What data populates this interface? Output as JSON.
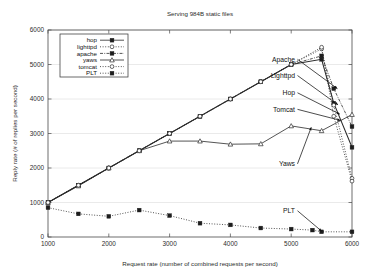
{
  "chart_data": {
    "type": "line",
    "title": "Serving 984B static files",
    "xlabel": "Request rate (number of combined requests per second)",
    "ylabel": "Reply rate (# of replies per second)",
    "xlim": [
      1000,
      6000
    ],
    "ylim": [
      0,
      6000
    ],
    "xticks": [
      1000,
      2000,
      3000,
      4000,
      5000,
      6000
    ],
    "yticks": [
      0,
      1000,
      2000,
      3000,
      4000,
      5000,
      6000
    ],
    "grid": true,
    "legend_position": "top-left",
    "series": [
      {
        "name": "hop",
        "marker": "filled-square",
        "dash": "solid",
        "x": [
          1000,
          1500,
          2000,
          2500,
          3000,
          3500,
          4000,
          4500,
          5000,
          5500,
          5700,
          6000
        ],
        "y": [
          1000,
          1500,
          2000,
          2500,
          3000,
          3500,
          4000,
          4500,
          5000,
          5150,
          3880,
          2600
        ]
      },
      {
        "name": "lighttpd",
        "marker": "open-circle",
        "dash": "dotted",
        "x": [
          1000,
          1500,
          2000,
          2500,
          3000,
          3500,
          4000,
          4500,
          5000,
          5500,
          5700,
          6000
        ],
        "y": [
          1000,
          1500,
          2000,
          2500,
          3000,
          3500,
          4000,
          4500,
          5000,
          5450,
          3820,
          1700
        ]
      },
      {
        "name": "apache",
        "marker": "filled-square",
        "dash": "dash-dot",
        "x": [
          1000,
          1500,
          2000,
          2500,
          3000,
          3500,
          4000,
          4500,
          5000,
          5500,
          5700,
          6000
        ],
        "y": [
          1000,
          1500,
          2000,
          2500,
          3000,
          3500,
          4000,
          4500,
          5000,
          5250,
          4300,
          3200
        ]
      },
      {
        "name": "yaws",
        "marker": "open-triangle",
        "dash": "solid",
        "x": [
          1000,
          1500,
          2000,
          2500,
          3000,
          3500,
          4000,
          4500,
          5000,
          5500,
          6000
        ],
        "y": [
          1000,
          1480,
          2000,
          2500,
          2780,
          2780,
          2690,
          2700,
          3220,
          3080,
          3550
        ]
      },
      {
        "name": "tomcat",
        "marker": "open-circle",
        "dash": "dotted",
        "x": [
          1000,
          1500,
          2000,
          2500,
          3000,
          3500,
          4000,
          4500,
          5000,
          5500,
          5700,
          6000
        ],
        "y": [
          1000,
          1500,
          2000,
          2500,
          3000,
          3500,
          4000,
          4500,
          5000,
          5500,
          3500,
          1620
        ]
      },
      {
        "name": "PLT",
        "marker": "filled-square",
        "dash": "dotted",
        "x": [
          1000,
          1500,
          2000,
          2500,
          3000,
          3500,
          4000,
          4500,
          5000,
          5350,
          5500,
          6000
        ],
        "y": [
          850,
          670,
          600,
          780,
          620,
          400,
          350,
          260,
          230,
          200,
          150,
          150
        ]
      }
    ],
    "annotations": [
      {
        "text": "Apache",
        "label_x": 295,
        "label_y": 5150,
        "tip_x": 5760,
        "tip_y": 4300
      },
      {
        "text": "Lighttpd",
        "label_x": 295,
        "label_y": 4680,
        "tip_x": 5770,
        "tip_y": 3830
      },
      {
        "text": "Hop",
        "label_x": 295,
        "label_y": 4180,
        "tip_x": 5800,
        "tip_y": 3560
      },
      {
        "text": "Tomcat",
        "label_x": 295,
        "label_y": 3700,
        "tip_x": 5810,
        "tip_y": 3380
      },
      {
        "text": "Yaws",
        "label_x": 295,
        "label_y": 2120,
        "tip_x": 5330,
        "tip_y": 3180
      },
      {
        "text": "PLT",
        "label_x": 295,
        "label_y": 760,
        "tip_x": 5500,
        "tip_y": 170
      }
    ]
  },
  "legend": {
    "items": [
      {
        "label": "hop"
      },
      {
        "label": "lighttpd"
      },
      {
        "label": "apache"
      },
      {
        "label": "yaws"
      },
      {
        "label": "tomcat"
      },
      {
        "label": "PLT"
      }
    ]
  }
}
